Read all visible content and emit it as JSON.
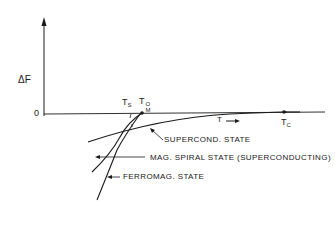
{
  "diagram": {
    "title": "",
    "y_axis": {
      "label": "ΔF",
      "zero_label": "0"
    },
    "x_axis": {
      "direction_label": "T",
      "arrow": "→"
    },
    "markers": [
      {
        "id": "Ts",
        "base": "T",
        "sub": "S"
      },
      {
        "id": "TM0",
        "base": "T",
        "sub": "M",
        "sup": "O"
      },
      {
        "id": "Tc",
        "base": "T",
        "sub": "C"
      }
    ],
    "curves": [
      {
        "id": "supercond",
        "label": "SUPERCOND. STATE"
      },
      {
        "id": "mag_spiral",
        "label": "MAG. SPIRAL STATE (SUPERCONDUCTING)"
      },
      {
        "id": "ferromag",
        "label": "FERROMAG. STATE"
      }
    ],
    "colors": {
      "ink": "#1a1a1a",
      "background": "#ffffff"
    }
  }
}
